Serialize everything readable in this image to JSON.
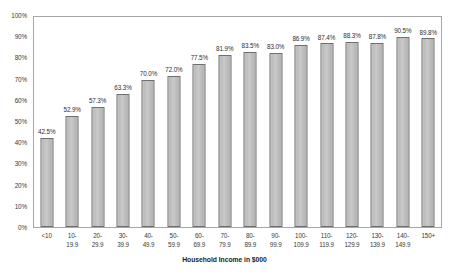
{
  "chart_data": {
    "type": "bar",
    "title": "",
    "subtitle": "",
    "xlabel": "Household Income in $000",
    "ylabel": "",
    "ylim": [
      0,
      100
    ],
    "ytick_labels": [
      "100%",
      "90%",
      "80%",
      "70%",
      "60%",
      "50%",
      "40%",
      "30%",
      "20%",
      "10%",
      "0%"
    ],
    "ytick_values": [
      100,
      90,
      80,
      70,
      60,
      50,
      40,
      30,
      20,
      10,
      0
    ],
    "grid": false,
    "legend": null,
    "categories": [
      "<10",
      "10-19.9",
      "20-29.9",
      "30-39.9",
      "40-49.9",
      "50-59.9",
      "60-69.9",
      "70-79.9",
      "80-89.9",
      "90-99.9",
      "100-109.9",
      "110-119.9",
      "120-129.9",
      "130-139.9",
      "140-149.9",
      "150+"
    ],
    "category_lines": [
      [
        "<10",
        ""
      ],
      [
        "10-",
        "19.9"
      ],
      [
        "20-",
        "29.9"
      ],
      [
        "30-",
        "39.9"
      ],
      [
        "40-",
        "49.9"
      ],
      [
        "50-",
        "59.9"
      ],
      [
        "60-",
        "69.9"
      ],
      [
        "70-",
        "79.9"
      ],
      [
        "80-",
        "89.9"
      ],
      [
        "90-",
        "99.9"
      ],
      [
        "100-",
        "109.9"
      ],
      [
        "110-",
        "119.9"
      ],
      [
        "120-",
        "129.9"
      ],
      [
        "130-",
        "139.9"
      ],
      [
        "140-",
        "149.9"
      ],
      [
        "150+",
        ""
      ]
    ],
    "values": [
      42.5,
      52.9,
      57.3,
      63.3,
      70.0,
      72.0,
      77.5,
      81.9,
      83.5,
      83.0,
      86.9,
      87.4,
      88.3,
      87.8,
      90.5,
      89.8
    ],
    "value_labels": [
      "42.5%",
      "52.9%",
      "57.3%",
      "63.3%",
      "70.0%",
      "72.0%",
      "77.5%",
      "81.9%",
      "83.5%",
      "83.0%",
      "86.9%",
      "87.4%",
      "88.3%",
      "87.8%",
      "90.5%",
      "89.8%"
    ],
    "colors": {
      "bar_fill": "#c4c4c4",
      "bar_border": "#6e6e6e",
      "plot_border": "#a6a6a6",
      "text": "#3a3a3a",
      "background": "#ffffff"
    }
  }
}
